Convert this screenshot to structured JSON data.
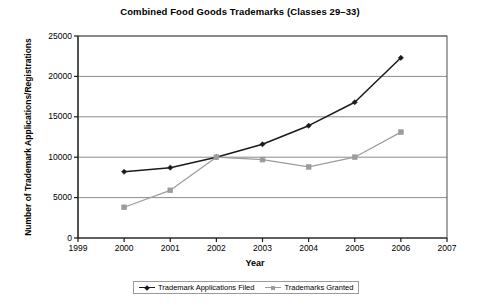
{
  "chart_data": {
    "type": "line",
    "title": "Combined Food Goods Trademarks (Classes 29–33)",
    "xlabel": "Year",
    "ylabel": "Number of Trademark Applications/Registrations",
    "x": [
      2000,
      2001,
      2002,
      2003,
      2004,
      2005,
      2006
    ],
    "xlim": [
      1999,
      2007
    ],
    "ylim": [
      0,
      25000
    ],
    "x_ticks": [
      "1999",
      "2000",
      "2001",
      "2002",
      "2003",
      "2004",
      "2005",
      "2006",
      "2007"
    ],
    "y_ticks": [
      "0",
      "5000",
      "10000",
      "15000",
      "20000",
      "25000"
    ],
    "grid": "horizontal",
    "legend_position": "bottom",
    "series": [
      {
        "name": "Trademark Applications Filed",
        "color": "#1a1a1a",
        "marker": "diamond",
        "values": [
          8200,
          8700,
          10000,
          11600,
          13900,
          16800,
          22300
        ]
      },
      {
        "name": "Trademarks Granted",
        "color": "#9c9c9c",
        "marker": "square",
        "values": [
          3800,
          5900,
          10000,
          9700,
          8800,
          10000,
          13100
        ]
      }
    ]
  }
}
